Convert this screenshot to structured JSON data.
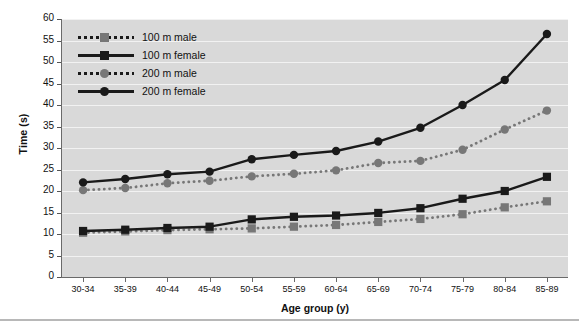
{
  "chart_data": {
    "type": "line",
    "title": "",
    "xlabel": "Age group (y)",
    "ylabel": "Time (s)",
    "categories": [
      "30-34",
      "35-39",
      "40-44",
      "45-49",
      "50-54",
      "55-59",
      "60-64",
      "65-69",
      "70-74",
      "75-79",
      "80-84",
      "85-89"
    ],
    "ylim": [
      0,
      60
    ],
    "yticks": [
      0,
      5,
      10,
      15,
      20,
      25,
      30,
      35,
      40,
      45,
      50,
      55,
      60
    ],
    "grid": true,
    "legend_position": "upper-left",
    "plot_background": "#d9d9d9",
    "gridline_color": "#f2f2f2",
    "series": [
      {
        "name": "100 m male",
        "style": "dotted",
        "marker": "square",
        "color": "#777777",
        "values": [
          10.3,
          10.6,
          10.9,
          11.1,
          11.3,
          11.7,
          12.1,
          12.8,
          13.5,
          14.6,
          16.2,
          17.6
        ]
      },
      {
        "name": "100 m female",
        "style": "solid",
        "marker": "square",
        "color": "#1a1a1a",
        "values": [
          10.7,
          11.0,
          11.4,
          11.7,
          13.4,
          14.0,
          14.3,
          14.9,
          16.0,
          18.2,
          20.0,
          23.3
        ]
      },
      {
        "name": "200 m male",
        "style": "dotted",
        "marker": "circle",
        "color": "#777777",
        "values": [
          20.2,
          20.7,
          21.8,
          22.4,
          23.4,
          24.0,
          24.8,
          26.5,
          27.0,
          29.6,
          34.3,
          38.7
        ]
      },
      {
        "name": "200 m female",
        "style": "solid",
        "marker": "circle",
        "color": "#1a1a1a",
        "values": [
          22.0,
          22.8,
          23.9,
          24.5,
          27.4,
          28.4,
          29.3,
          31.5,
          34.7,
          40.0,
          45.8,
          56.5
        ]
      }
    ]
  },
  "legend": {
    "items": [
      {
        "label": "100 m male"
      },
      {
        "label": "100 m female"
      },
      {
        "label": "200 m male"
      },
      {
        "label": "200 m female"
      }
    ]
  }
}
